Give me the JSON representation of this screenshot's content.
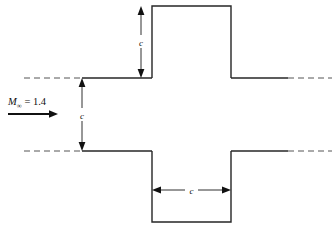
{
  "figure": {
    "name": "supersonic-channel-with-square-cavities",
    "background_color": "#ffffff",
    "line_color": "#262626",
    "dash_color": "#555555",
    "width": 335,
    "height": 227
  },
  "flow": {
    "mach_symbol": "M",
    "mach_subscript": "∞",
    "equals": " = ",
    "mach_value": "1.4",
    "arrow_direction": "right",
    "arrow_name": "freestream-flow-arrow"
  },
  "dimensions": [
    {
      "id": "upper-cavity-height",
      "label": "c",
      "orientation": "vertical",
      "location": "upper-cavity"
    },
    {
      "id": "channel-height",
      "label": "c",
      "orientation": "vertical",
      "location": "channel-midsection"
    },
    {
      "id": "lower-cavity-width",
      "label": "c",
      "orientation": "horizontal",
      "location": "lower-cavity"
    }
  ],
  "geometry": {
    "upper_cavity_name": "upper-square-cavity",
    "lower_cavity_name": "lower-square-cavity",
    "upper_wall_name": "upper-channel-wall",
    "lower_wall_name": "lower-channel-wall",
    "upstream_dash_upper_name": "upstream-upper-dashed-extension",
    "upstream_dash_lower_name": "upstream-lower-dashed-extension",
    "downstream_dash_upper_name": "downstream-upper-dashed-extension",
    "downstream_dash_lower_name": "downstream-lower-dashed-extension"
  }
}
